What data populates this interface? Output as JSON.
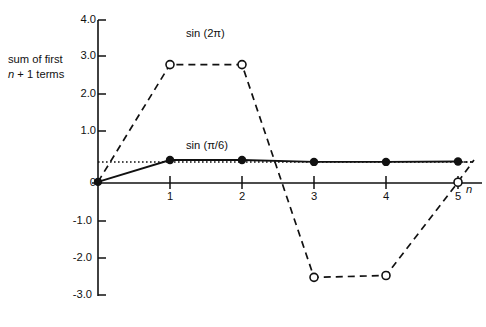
{
  "chart_data": {
    "type": "line",
    "title": "",
    "subtitle": "",
    "xlabel": "n",
    "ylabel": "sum of first n + 1 terms",
    "ylabel_line1": "sum of first",
    "ylabel_line2_italic": "n",
    "ylabel_line2_rest": " + 1 terms",
    "xlim": [
      0,
      5.4
    ],
    "ylim": [
      -3.0,
      4.0
    ],
    "grid": false,
    "legend_position": "inline-annotation",
    "x": [
      0,
      1,
      2,
      3,
      4,
      5
    ],
    "xticks": [
      1,
      2,
      3,
      4,
      5
    ],
    "xtick_labels": [
      "1",
      "2",
      "3",
      "4",
      "5"
    ],
    "yticks": [
      4.0,
      3.0,
      2.0,
      1.0,
      0,
      -1.0,
      -2.0,
      -3.0
    ],
    "ytick_labels": [
      "4.0",
      "3.0",
      "2.0",
      "1.0",
      "0",
      "-1.0",
      "-2.0",
      "-3.0"
    ],
    "series": [
      {
        "name": "sin (2π)",
        "label": "sin (2π)",
        "style": "dashed",
        "marker": "open-circle",
        "color": "#000000",
        "values": [
          0.03,
          3.2,
          3.2,
          -2.55,
          -2.5,
          0.02
        ]
      },
      {
        "name": "sin (π/6)",
        "label": "sin (π/6)",
        "style": "solid",
        "marker": "filled-circle",
        "color": "#000000",
        "values": [
          0.03,
          0.62,
          0.62,
          0.57,
          0.57,
          0.58
        ]
      }
    ],
    "reference_line": {
      "name": "asymptote",
      "style": "dotted",
      "y": 0.57,
      "color": "#000000"
    },
    "annotations": [
      {
        "text": "sin (2π)",
        "x": 1.5,
        "y": 3.62
      },
      {
        "text": "sin (π/6)",
        "x": 1.5,
        "y": 1.05
      },
      {
        "text": "n",
        "x": 5.25,
        "y": -0.08
      }
    ]
  },
  "caption": ""
}
